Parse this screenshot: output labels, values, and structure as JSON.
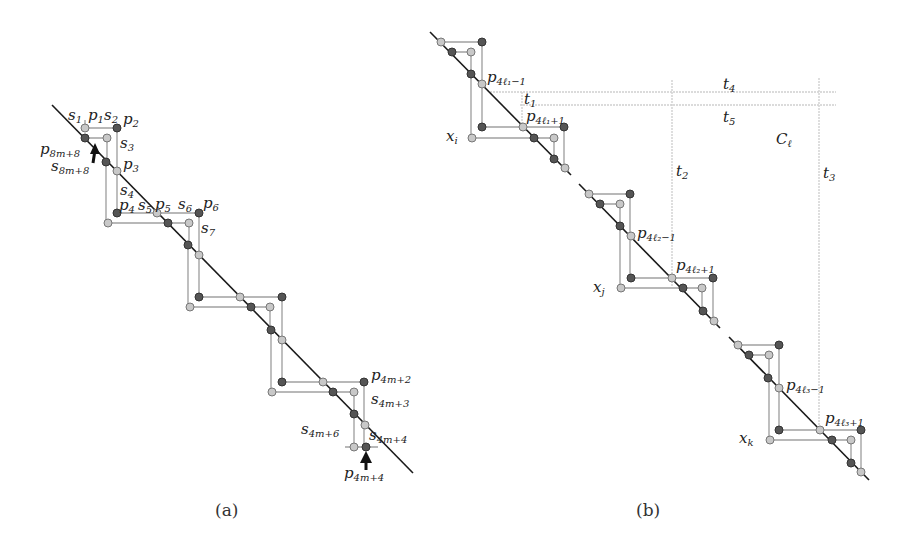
{
  "figure": {
    "panel_a": {
      "caption": "(a)",
      "labels": {
        "s1": {
          "base": "s",
          "sub": "1"
        },
        "p1": {
          "base": "p",
          "sub": "1"
        },
        "s2": {
          "base": "s",
          "sub": "2"
        },
        "p2": {
          "base": "p",
          "sub": "2"
        },
        "s3": {
          "base": "s",
          "sub": "3"
        },
        "p3": {
          "base": "p",
          "sub": "3"
        },
        "p8m8": {
          "base": "p",
          "sub": "8m+8"
        },
        "s8m8": {
          "base": "s",
          "sub": "8m+8"
        },
        "s4": {
          "base": "s",
          "sub": "4"
        },
        "p4": {
          "base": "p",
          "sub": "4"
        },
        "s5": {
          "base": "s",
          "sub": "5"
        },
        "p5": {
          "base": "p",
          "sub": "5"
        },
        "s6": {
          "base": "s",
          "sub": "6"
        },
        "p6": {
          "base": "p",
          "sub": "6"
        },
        "s7": {
          "base": "s",
          "sub": "7"
        },
        "p4m2": {
          "base": "p",
          "sub": "4m+2"
        },
        "s4m3": {
          "base": "s",
          "sub": "4m+3"
        },
        "s4m6": {
          "base": "s",
          "sub": "4m+6"
        },
        "s4m4": {
          "base": "s",
          "sub": "4m+4"
        },
        "p4m4": {
          "base": "p",
          "sub": "4m+4"
        }
      }
    },
    "panel_b": {
      "caption": "(b)",
      "labels": {
        "p4l1m1": {
          "base": "p",
          "sub": "4ℓ₁−1"
        },
        "t1": {
          "base": "t",
          "sub": "1"
        },
        "p4l1p1": {
          "base": "p",
          "sub": "4ℓ₁+1"
        },
        "xi": {
          "base": "x",
          "sub": "i"
        },
        "t4": {
          "base": "t",
          "sub": "4"
        },
        "t5": {
          "base": "t",
          "sub": "5"
        },
        "Cl": {
          "base": "C",
          "sub": "ℓ"
        },
        "t2": {
          "base": "t",
          "sub": "2"
        },
        "t3": {
          "base": "t",
          "sub": "3"
        },
        "p4l2m1": {
          "base": "p",
          "sub": "4ℓ₂−1"
        },
        "p4l2p1": {
          "base": "p",
          "sub": "4ℓ₂+1"
        },
        "xj": {
          "base": "x",
          "sub": "j"
        },
        "p4l3m1": {
          "base": "p",
          "sub": "4ℓ₃−1"
        },
        "p4l3p1": {
          "base": "p",
          "sub": "4ℓ₃+1"
        },
        "xk": {
          "base": "x",
          "sub": "k"
        }
      }
    },
    "colors": {
      "dark_point": "#555555",
      "light_point": "#c8c8c8",
      "segment": "#b8b8b8",
      "diagonal": "#1a1a1a"
    }
  }
}
